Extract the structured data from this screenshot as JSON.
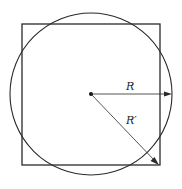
{
  "diagram": {
    "labels": {
      "r": "R",
      "r_prime": "R′"
    },
    "colors": {
      "stroke": "#2a2a2a",
      "background": "#ffffff"
    }
  }
}
